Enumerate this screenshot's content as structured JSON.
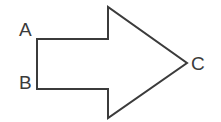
{
  "figure": {
    "background_color": "#ffffff",
    "stroke_color": "#3b3b3b",
    "fill_color": "#ffffff",
    "stroke_width": 2,
    "width": 221,
    "height": 122
  },
  "shape": {
    "name": "right-pointing-block-arrow",
    "points": "37,39 108,39 108,7 187,63 108,118 108,89 37,89",
    "vertex_count": 7
  },
  "labels": [
    {
      "id": "A",
      "text": "A",
      "x": 19,
      "y": 36,
      "anchor": "start",
      "describes": "top-left corner of arrow shaft"
    },
    {
      "id": "B",
      "text": "B",
      "x": 19,
      "y": 89,
      "anchor": "start",
      "describes": "bottom-left corner of arrow shaft"
    },
    {
      "id": "C",
      "text": "C",
      "x": 191,
      "y": 70,
      "anchor": "start",
      "describes": "arrow tip / point"
    }
  ]
}
